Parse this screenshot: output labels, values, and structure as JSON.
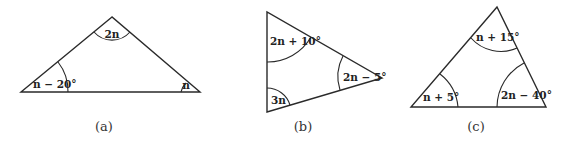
{
  "figure": {
    "triangles": [
      {
        "id": "a",
        "caption": "(a)",
        "angles": {
          "top": "2n",
          "left": "n − 20°",
          "right": "n"
        }
      },
      {
        "id": "b",
        "caption": "(b)",
        "angles": {
          "top_left": "2n + 10°",
          "bottom_left": "3n",
          "right": "2n − 5°"
        }
      },
      {
        "id": "c",
        "caption": "(c)",
        "angles": {
          "top": "n + 15°",
          "bottom_left": "n + 5°",
          "bottom_right": "2n − 40°"
        }
      }
    ],
    "colors": {
      "line": "#2a2a2a",
      "text": "#222222",
      "background": "#ffffff"
    }
  }
}
